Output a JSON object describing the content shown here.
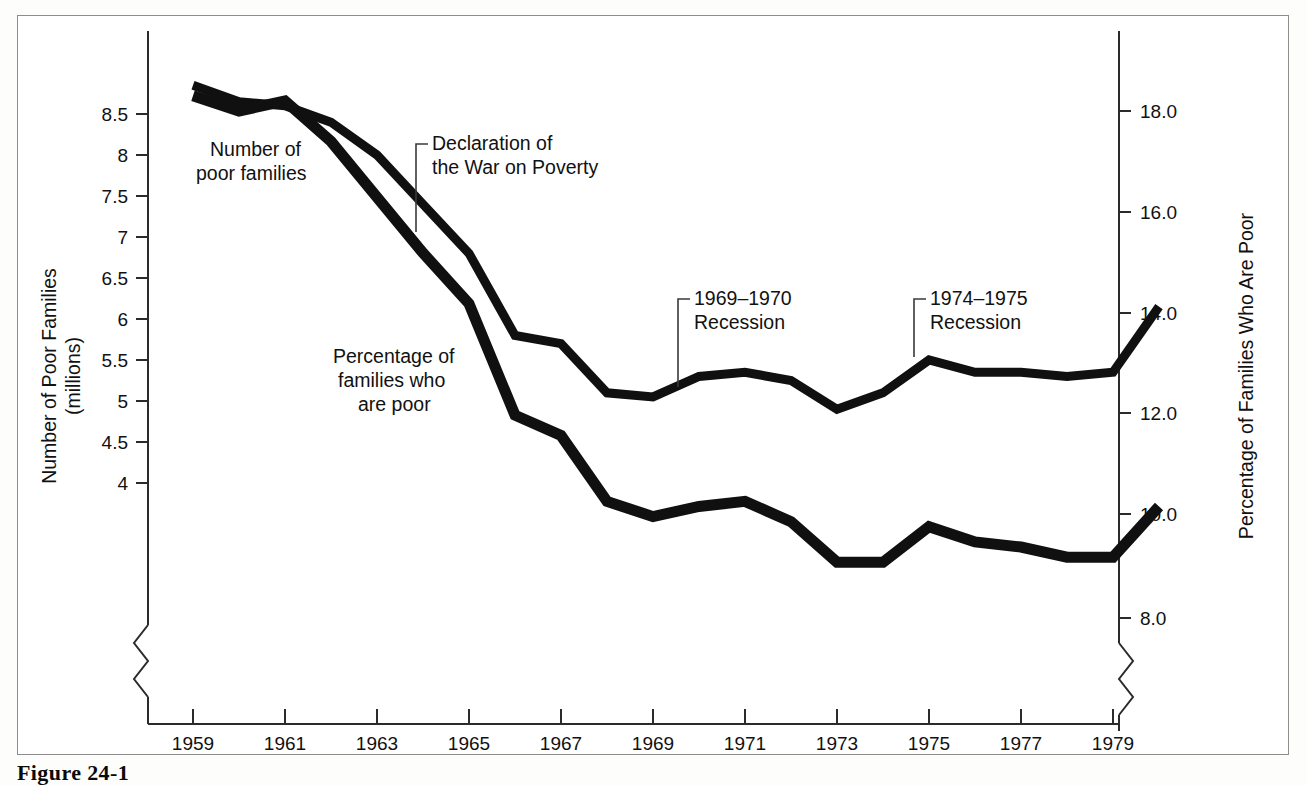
{
  "figure": {
    "caption": "Figure 24-1",
    "background_color": "#ffffff",
    "frame_color": "#8d8d8d",
    "line_color": "#101010"
  },
  "left_axis": {
    "title_line1": "Number of Poor Families",
    "title_line2": "(millions)",
    "ticks": [
      "8.5",
      "8",
      "7.5",
      "7",
      "6.5",
      "6",
      "5.5",
      "5",
      "4.5",
      "4"
    ],
    "has_break": true
  },
  "right_axis": {
    "title": "Percentage of Families Who Are Poor",
    "ticks": [
      "18.0",
      "16.0",
      "14.0",
      "12.0",
      "10.0",
      "8.0"
    ],
    "has_break": true
  },
  "x_axis": {
    "ticks": [
      "1959",
      "1961",
      "1963",
      "1965",
      "1967",
      "1969",
      "1971",
      "1973",
      "1975",
      "1977",
      "1979"
    ]
  },
  "series_labels": {
    "number_of_poor_families": "Number of\npoor families",
    "number_of_poor_families_line1": "Number of",
    "number_of_poor_families_line2": "poor families",
    "percentage_line1": "Percentage of",
    "percentage_line2": "families who",
    "percentage_line3": "are poor"
  },
  "annotations": [
    {
      "name": "war-on-poverty",
      "line1": "Declaration of",
      "line2": "the War on Poverty"
    },
    {
      "name": "recession-1969-1970",
      "line1": "1969–1970",
      "line2": "Recession"
    },
    {
      "name": "recession-1974-1975",
      "line1": "1974–1975",
      "line2": "Recession"
    }
  ],
  "chart_data": {
    "type": "line",
    "title": "Figure 24-1",
    "xlabel": "",
    "ylabel": "Number of Poor Families (millions)",
    "y2label": "Percentage of Families Who Are Poor",
    "grid": false,
    "legend": "inline-labels",
    "x": [
      1959,
      1960,
      1961,
      1962,
      1963,
      1964,
      1965,
      1966,
      1967,
      1968,
      1969,
      1970,
      1971,
      1972,
      1973,
      1974,
      1975,
      1976,
      1977,
      1978,
      1979,
      1980
    ],
    "xlim": [
      1959,
      1980
    ],
    "ylim": [
      3.55,
      8.95
    ],
    "y2lim": [
      7.1,
      18.85
    ],
    "xticks": [
      1959,
      1961,
      1963,
      1965,
      1967,
      1969,
      1971,
      1973,
      1975,
      1977,
      1979
    ],
    "yticks": [
      4,
      4.5,
      5,
      5.5,
      6,
      6.5,
      7,
      7.5,
      8,
      8.5
    ],
    "y2ticks": [
      8.0,
      10.0,
      12.0,
      14.0,
      16.0,
      18.0
    ],
    "series": [
      {
        "name": "Number of poor families",
        "axis": "left",
        "units": "millions",
        "values": [
          8.85,
          8.65,
          8.6,
          8.4,
          8.0,
          7.4,
          6.8,
          5.8,
          5.7,
          5.1,
          5.05,
          5.3,
          5.35,
          5.25,
          4.9,
          5.1,
          5.5,
          5.35,
          5.35,
          5.3,
          5.35,
          6.15
        ]
      },
      {
        "name": "Percentage of families who are poor",
        "axis": "right",
        "units": "percent",
        "values": [
          18.3,
          18.0,
          18.2,
          17.4,
          16.3,
          15.2,
          14.2,
          12.0,
          11.6,
          10.3,
          10.0,
          10.2,
          10.3,
          9.9,
          9.1,
          9.1,
          9.8,
          9.5,
          9.4,
          9.2,
          9.2,
          10.2
        ]
      }
    ],
    "annotations": [
      {
        "text": "Declaration of the War on Poverty",
        "x": 1964
      },
      {
        "text": "1969–1970 Recession",
        "x": 1970
      },
      {
        "text": "1974–1975 Recession",
        "x": 1975
      }
    ]
  }
}
